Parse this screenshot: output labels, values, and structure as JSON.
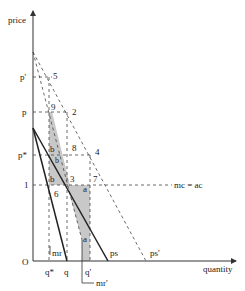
{
  "diagram": {
    "axes": {
      "y_label": "price",
      "x_label": "quantity",
      "origin_label": "O"
    },
    "price_ticks": [
      "p'",
      "p",
      "p*",
      "1"
    ],
    "quantity_ticks": [
      "q*",
      "q",
      "q'"
    ],
    "curve_labels": {
      "mc_ac": "mc = ac",
      "mr": "mr",
      "mr_prime": "mr'",
      "ps": "ps",
      "ps_prime": "ps'"
    },
    "point_labels": [
      "5",
      "9",
      "2",
      "8",
      "4",
      "3",
      "7",
      "6"
    ],
    "area_labels": {
      "b1": "b",
      "b2": "b",
      "b3": "b",
      "a1": "a",
      "a2": "a"
    },
    "colors": {
      "shade": "#c8c8c8",
      "line": "#222222"
    }
  }
}
